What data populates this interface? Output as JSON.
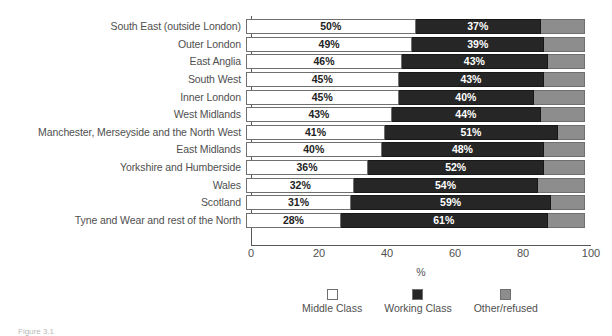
{
  "chart_data": {
    "type": "bar",
    "subtype": "horizontal-stacked-100",
    "title": "",
    "xlabel": "%",
    "ylabel": "",
    "xlim": [
      0,
      100
    ],
    "xticks": [
      0,
      20,
      40,
      60,
      80,
      100
    ],
    "grid": false,
    "legend_position": "bottom-center",
    "categories": [
      "South East (outside London)",
      "Outer London",
      "East Anglia",
      "South West",
      "Inner London",
      "West Midlands",
      "Manchester, Merseyside and the North West",
      "East Midlands",
      "Yorkshire and Humberside",
      "Wales",
      "Scotland",
      "Tyne and Wear and rest of the North"
    ],
    "series": [
      {
        "name": "Middle Class",
        "color": "#ffffff",
        "values": [
          50,
          49,
          46,
          45,
          45,
          43,
          41,
          40,
          36,
          32,
          31,
          28
        ],
        "labels": [
          "50%",
          "49%",
          "46%",
          "45%",
          "45%",
          "43%",
          "41%",
          "40%",
          "36%",
          "32%",
          "31%",
          "28%"
        ]
      },
      {
        "name": "Working Class",
        "color": "#262626",
        "values": [
          37,
          39,
          43,
          43,
          40,
          44,
          51,
          48,
          52,
          54,
          59,
          61
        ],
        "labels": [
          "37%",
          "39%",
          "43%",
          "43%",
          "40%",
          "44%",
          "51%",
          "48%",
          "52%",
          "54%",
          "59%",
          "61%"
        ]
      },
      {
        "name": "Other/refused",
        "color": "#8d8d8d",
        "values": [
          13,
          12,
          11,
          12,
          15,
          13,
          8,
          12,
          12,
          14,
          10,
          11
        ],
        "labels": [
          "",
          "",
          "",
          "",
          "",
          "",
          "",
          "",
          "",
          "",
          "",
          ""
        ]
      }
    ]
  },
  "axis": {
    "x_title": "%",
    "tick_labels": [
      "0",
      "20",
      "40",
      "60",
      "80",
      "100"
    ]
  },
  "legend": {
    "items": [
      {
        "label": "Middle Class",
        "swatch": "#ffffff"
      },
      {
        "label": "Working Class",
        "swatch": "#262626"
      },
      {
        "label": "Other/refused",
        "swatch": "#8d8d8d"
      }
    ]
  },
  "caption": {
    "text": "Figure 3.1"
  }
}
